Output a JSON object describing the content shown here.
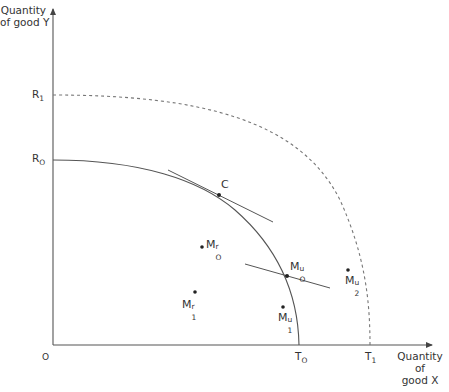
{
  "diagram": {
    "type": "production-possibility-frontier",
    "y_axis_title": [
      "Quantity",
      "of good Y"
    ],
    "x_axis_title": [
      "Quantity",
      "of",
      "good X"
    ],
    "origin_label": "O",
    "y_ticks": [
      {
        "base": "R",
        "sub": "1"
      },
      {
        "base": "R",
        "sub": "O"
      }
    ],
    "x_ticks": [
      {
        "base": "T",
        "sub": "O"
      },
      {
        "base": "T",
        "sub": "1"
      }
    ],
    "points": [
      {
        "id": "C",
        "base": "C",
        "sup": "",
        "sub": ""
      },
      {
        "id": "M0r",
        "base": "M",
        "sup": "r",
        "sub": "O"
      },
      {
        "id": "M1r",
        "base": "M",
        "sup": "r",
        "sub": "1"
      },
      {
        "id": "M0u",
        "base": "M",
        "sup": "u",
        "sub": "O"
      },
      {
        "id": "M1u",
        "base": "M",
        "sup": "u",
        "sub": "1"
      },
      {
        "id": "M2u",
        "base": "M",
        "sup": "u",
        "sub": "2"
      }
    ],
    "curves": [
      {
        "name": "frontier-R0-T0",
        "style": "solid"
      },
      {
        "name": "frontier-R1-T1",
        "style": "dashed"
      }
    ],
    "colors": {
      "line": "#555555",
      "dashed": "#777777",
      "text": "#333333"
    }
  }
}
